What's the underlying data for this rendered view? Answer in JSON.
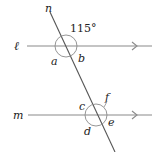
{
  "diagram": {
    "type": "parallel-lines-transversal",
    "lines": {
      "l": {
        "label": "ℓ",
        "color": "#777777"
      },
      "m": {
        "label": "m",
        "color": "#777777"
      },
      "n": {
        "label": "n",
        "color": "#555555"
      }
    },
    "given_angle": {
      "value": "115°"
    },
    "angle_labels": {
      "a": "a",
      "b": "b",
      "c": "c",
      "d": "d",
      "e": "e",
      "f": "f"
    }
  }
}
